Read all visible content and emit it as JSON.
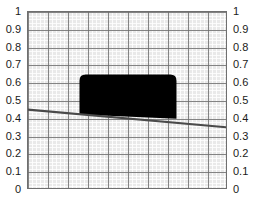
{
  "chart_data": {
    "type": "area",
    "title": "",
    "subtitle": "",
    "xlabel": "",
    "ylabel": "",
    "xlim": [
      0,
      1
    ],
    "ylim": [
      0,
      1
    ],
    "grid": true,
    "grid_major_step": 0.1,
    "grid_minor_step": 0.02,
    "legend": "none",
    "background_color": "#e9e9e9",
    "frame_color": "#6f6f6f",
    "left_axis_ticks": [
      "1",
      "0.9",
      "0.8",
      "0.7",
      "0.6",
      "0.5",
      "0.4",
      "0.3",
      "0.2",
      "0.1",
      "0"
    ],
    "right_axis_ticks": [
      "1",
      "0.9",
      "0.8",
      "0.7",
      "0.6",
      "0.5",
      "0.4",
      "0.3",
      "0.2",
      "0.1",
      "0"
    ],
    "tick_values": [
      1,
      0.9,
      0.8,
      0.7,
      0.6,
      0.5,
      0.4,
      0.3,
      0.2,
      0.1,
      0
    ],
    "series": [
      {
        "name": "baseline-trend-line",
        "type": "line",
        "color": "#4a4a4a",
        "width": 2,
        "x": [
          0.0,
          1.0
        ],
        "values": [
          0.445,
          0.345
        ]
      },
      {
        "name": "filled-block",
        "type": "area",
        "color": "#000000",
        "x_start": 0.26,
        "x_end": 0.75,
        "y_top": 0.645,
        "y_bottom_left": 0.418,
        "y_bottom_right": 0.394,
        "corner_radius": 0.035
      }
    ]
  }
}
